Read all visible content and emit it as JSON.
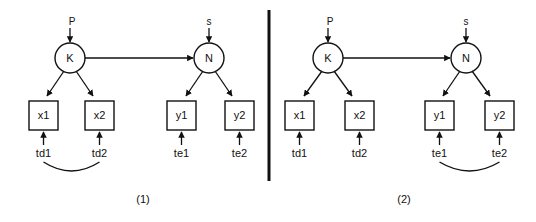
{
  "figure": {
    "type": "path-diagram",
    "background_color": "#ffffff",
    "line_color": "#111111",
    "divider": {
      "present": true,
      "orientation": "vertical"
    },
    "panels": [
      {
        "caption": "(1)",
        "latent_left": {
          "label": "K",
          "shape": "circle"
        },
        "latent_right": {
          "label": "N",
          "shape": "circle"
        },
        "disturbance_left": {
          "label": "P"
        },
        "disturbance_right": {
          "label": "s"
        },
        "indicators": [
          {
            "label": "x1",
            "shape": "box",
            "error": "td1"
          },
          {
            "label": "x2",
            "shape": "box",
            "error": "td2"
          },
          {
            "label": "y1",
            "shape": "box",
            "error": "te1"
          },
          {
            "label": "y2",
            "shape": "box",
            "error": "te2"
          }
        ],
        "correlated_errors": {
          "from": "td1",
          "to": "td2",
          "side": "left"
        }
      },
      {
        "caption": "(2)",
        "latent_left": {
          "label": "K",
          "shape": "circle"
        },
        "latent_right": {
          "label": "N",
          "shape": "circle"
        },
        "disturbance_left": {
          "label": "P"
        },
        "disturbance_right": {
          "label": "s"
        },
        "indicators": [
          {
            "label": "x1",
            "shape": "box",
            "error": "td1"
          },
          {
            "label": "x2",
            "shape": "box",
            "error": "td2"
          },
          {
            "label": "y1",
            "shape": "box",
            "error": "te1"
          },
          {
            "label": "y2",
            "shape": "box",
            "error": "te2"
          }
        ],
        "correlated_errors": {
          "from": "te1",
          "to": "te2",
          "side": "right"
        }
      }
    ]
  },
  "labels": {
    "p1_P": "P",
    "p1_s": "s",
    "p1_K": "K",
    "p1_N": "N",
    "p1_x1": "x1",
    "p1_x2": "x2",
    "p1_y1": "y1",
    "p1_y2": "y2",
    "p1_td1": "td1",
    "p1_td2": "td2",
    "p1_te1": "te1",
    "p1_te2": "te2",
    "p1_caption": "(1)",
    "p2_P": "P",
    "p2_s": "s",
    "p2_K": "K",
    "p2_N": "N",
    "p2_x1": "x1",
    "p2_x2": "x2",
    "p2_y1": "y1",
    "p2_y2": "y2",
    "p2_td1": "td1",
    "p2_td2": "td2",
    "p2_te1": "te1",
    "p2_te2": "te2",
    "p2_caption": "(2)"
  }
}
